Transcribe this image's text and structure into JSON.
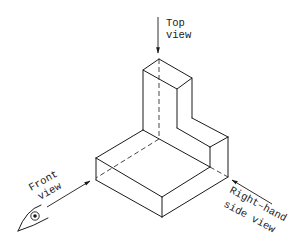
{
  "diagram": {
    "type": "isometric-projection-views",
    "labels": {
      "top_line1": "Top",
      "top_line2": "view",
      "front_line1": "Front",
      "front_line2": "view",
      "side_line1": "Right–hand",
      "side_line2": "side view"
    },
    "icons": {
      "observer": "eye-icon"
    },
    "colors": {
      "line": "#1a1a1a",
      "background": "#ffffff"
    }
  }
}
